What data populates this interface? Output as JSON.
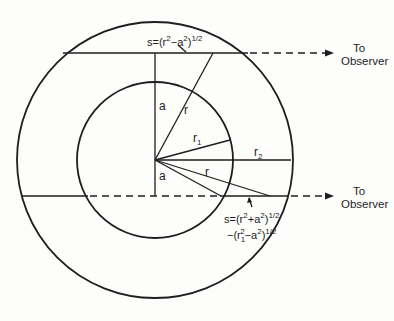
{
  "figure": {
    "center": {
      "x": 155,
      "y": 160
    },
    "outer_radius": 138,
    "inner_radius": 78,
    "a_offset": 36,
    "stroke_color": "#1e1e1e",
    "background": "#fdfdfc"
  },
  "labels": {
    "a_top": "a",
    "a_bottom": "a",
    "r_top": "r",
    "r_bottom": "r",
    "r1": {
      "base": "r",
      "sub": "1"
    },
    "r2": {
      "base": "r",
      "sub": "2"
    }
  },
  "observers": [
    {
      "line1": "To",
      "line2": "Observer"
    },
    {
      "line1": "To",
      "line2": "Observer"
    }
  ],
  "equations": {
    "top": {
      "prefix": "s=(r",
      "sup1": "2",
      "mid": "−a",
      "sup2": "2",
      "close": ")",
      "sup3": "1/2"
    },
    "bottom": {
      "line1": {
        "prefix": "s=(r",
        "sup1": "2",
        "mid": "+a",
        "sup2": "2",
        "close": ")",
        "sup3": "1/2"
      },
      "line2": {
        "prefix": "−(r",
        "sub": "1",
        "sup1": "2",
        "mid": "−a",
        "sup2": "2",
        "close": ")",
        "sup3": "1/2"
      }
    }
  }
}
